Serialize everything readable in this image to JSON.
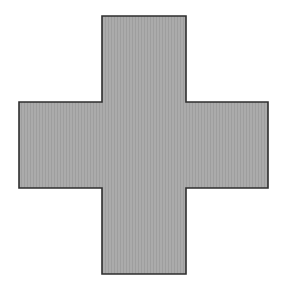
{
  "figure": {
    "shape": "cross",
    "fill_color": "#ababab",
    "stripe_color": "#9e9e9e",
    "stroke_color": "#2e2e2e",
    "background_color": "#ffffff",
    "points": "102,16 186,16 186,102 268,102 268,188 186,188 186,274 102,274 102,188 19,188 19,102 102,102"
  }
}
